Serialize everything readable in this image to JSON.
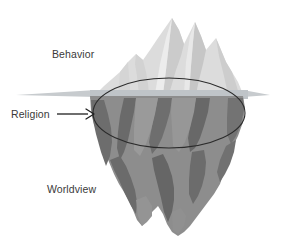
{
  "diagram": {
    "type": "iceberg-metaphor",
    "title_visible": false,
    "background_color": "#ffffff",
    "labels": {
      "above_water": "Behavior",
      "at_waterline": "Religion",
      "below_water": "Worldview"
    },
    "annotations": {
      "arrow": {
        "name": "religion-arrow",
        "direction": "right",
        "points_to": "waterline-ellipse"
      },
      "ellipse": {
        "name": "waterline-ellipse",
        "stroke_color": "#2b2b2b",
        "fill": "none"
      }
    },
    "colors": {
      "ice_light": "#dcdcdc",
      "ice_light_shade": "#cfcfcf",
      "water_line": "#c9cdd0",
      "ice_mid": "#8d8d8d",
      "ice_dark": "#6e6e6e",
      "ice_darkest": "#636363",
      "outline": "#2b2b2b",
      "text": "#3a3a3a"
    },
    "parts": {
      "above_water_label": "Behavior",
      "waterline_label": "Religion",
      "below_water_label": "Worldview"
    }
  }
}
